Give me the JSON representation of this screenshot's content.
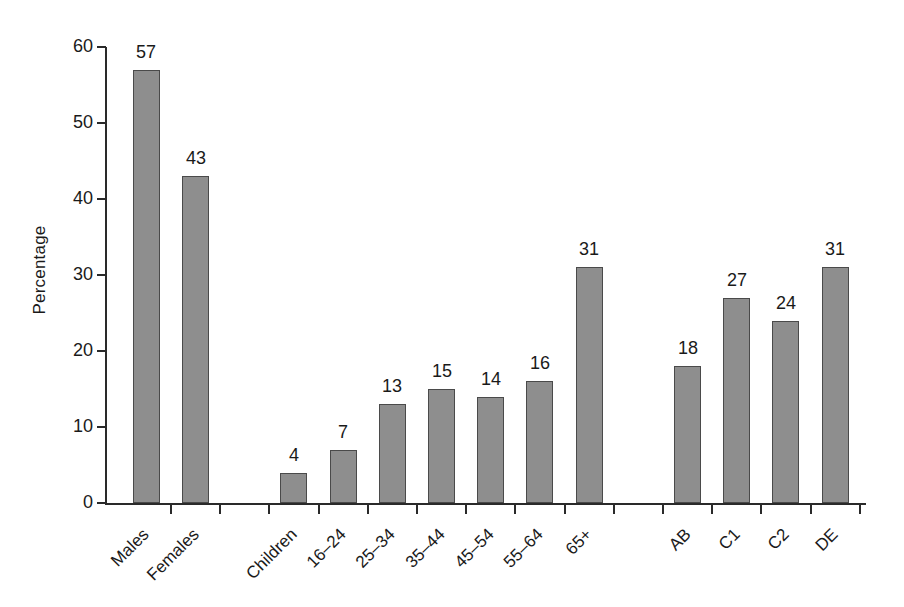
{
  "chart_data": {
    "type": "bar",
    "title": "",
    "subtitle": "",
    "xlabel": "",
    "ylabel": "Percentage",
    "ylim": [
      0,
      60
    ],
    "ytick_values": [
      0,
      10,
      20,
      30,
      40,
      50,
      60
    ],
    "ytick_labels": [
      "0",
      "10",
      "20",
      "30",
      "40",
      "50",
      "60"
    ],
    "grid": false,
    "legend": null,
    "legend_position": "none",
    "bar_color": "#8e8e8e",
    "bar_edge_color": "#4a4a4a",
    "axis_color": "#2a2a2a",
    "data_labels_shown": true,
    "category_label_rotation": -45,
    "groups": [
      {
        "name": "Sex",
        "categories": [
          "Males",
          "Females"
        ],
        "values": [
          57,
          43
        ]
      },
      {
        "name": "Age",
        "categories": [
          "Children",
          "16–24",
          "25–34",
          "35–44",
          "45–54",
          "55–64",
          "65+"
        ],
        "values": [
          4,
          7,
          13,
          15,
          14,
          16,
          31
        ]
      },
      {
        "name": "Social grade",
        "categories": [
          "AB",
          "C1",
          "C2",
          "DE"
        ],
        "values": [
          18,
          27,
          24,
          31
        ]
      }
    ],
    "categories": [
      "Males",
      "Females",
      "",
      "Children",
      "16–24",
      "25–34",
      "35–44",
      "45–54",
      "55–64",
      "65+",
      "",
      "AB",
      "C1",
      "C2",
      "DE"
    ],
    "values": [
      57,
      43,
      null,
      4,
      7,
      13,
      15,
      14,
      16,
      31,
      null,
      18,
      27,
      24,
      31
    ],
    "value_labels": [
      "57",
      "43",
      "",
      "4",
      "7",
      "13",
      "15",
      "14",
      "16",
      "31",
      "",
      "18",
      "27",
      "24",
      "31"
    ]
  }
}
